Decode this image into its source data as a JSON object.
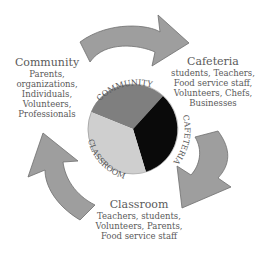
{
  "diagram": {
    "type": "cycle",
    "colors": {
      "arrow_fill": "#9e9e9e",
      "arrow_stroke": "#6e6e6e",
      "community_slice": "#7f7f7f",
      "cafeteria_slice": "#0a0a0a",
      "classroom_slice": "#cfcfcf",
      "text": "#5a5a5a"
    },
    "pie": {
      "labels": [
        "COMMUNITY",
        "CAFETERIA",
        "CLASSROOM"
      ]
    },
    "community": {
      "title": "Community",
      "lines": [
        "Parents,",
        "organizations,",
        "Individuals,",
        "Volunteers,",
        "Professionals"
      ]
    },
    "cafeteria": {
      "title": "Cafeteria",
      "lines": [
        "students, Teachers,",
        "Food service staff,",
        "Volunteers, Chefs,",
        "Businesses"
      ]
    },
    "classroom": {
      "title": "Classroom",
      "lines": [
        "Teachers, students,",
        "Volunteers, Parents,",
        "Food service staff"
      ]
    }
  }
}
